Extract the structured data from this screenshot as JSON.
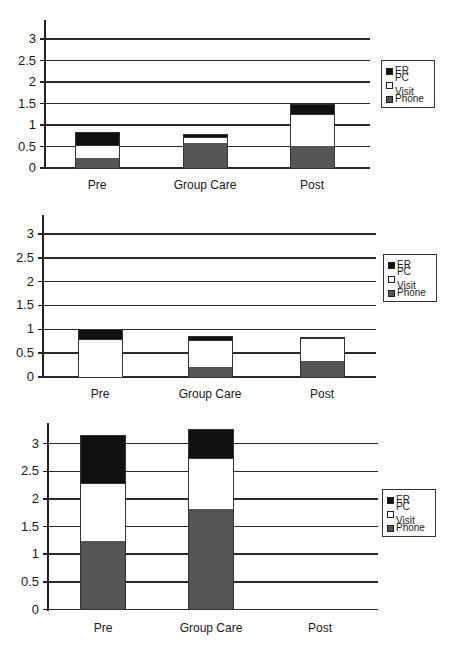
{
  "legend": {
    "items": [
      {
        "label": "ER",
        "color": "#111111"
      },
      {
        "label": "PC Visit",
        "color": "#ffffff"
      },
      {
        "label": "Phone",
        "color": "#555555"
      }
    ]
  },
  "chart_data": [
    {
      "type": "bar",
      "stacked": true,
      "title": "",
      "xlabel": "",
      "ylabel": "",
      "categories": [
        "Pre",
        "Group Care",
        "Post"
      ],
      "yticks": [
        "0",
        "0.5",
        "1",
        "1.5",
        "2",
        "2.5",
        "3"
      ],
      "ylim": [
        0,
        3.4
      ],
      "grid": true,
      "legend_position": "right",
      "series": [
        {
          "name": "Phone",
          "values": [
            0.23,
            0.6,
            0.53
          ]
        },
        {
          "name": "PC Visit",
          "values": [
            0.32,
            0.15,
            0.74
          ]
        },
        {
          "name": "ER",
          "values": [
            0.28,
            0.05,
            0.21
          ]
        }
      ],
      "totals": [
        0.83,
        0.8,
        1.48
      ]
    },
    {
      "type": "bar",
      "stacked": true,
      "title": "",
      "xlabel": "",
      "ylabel": "",
      "categories": [
        "Pre",
        "Group Care",
        "Post"
      ],
      "yticks": [
        "0",
        "0.5",
        "1",
        "1.5",
        "2",
        "2.5",
        "3"
      ],
      "ylim": [
        0,
        3.4
      ],
      "grid": true,
      "legend_position": "right",
      "series": [
        {
          "name": "Phone",
          "values": [
            0.0,
            0.21,
            0.34
          ]
        },
        {
          "name": "PC Visit",
          "values": [
            0.81,
            0.58,
            0.5
          ]
        },
        {
          "name": "ER",
          "values": [
            0.19,
            0.08,
            0.0
          ]
        }
      ],
      "totals": [
        1.0,
        0.87,
        0.84
      ]
    },
    {
      "type": "bar",
      "stacked": true,
      "title": "",
      "xlabel": "",
      "ylabel": "",
      "categories": [
        "Pre",
        "Group Care",
        "Post"
      ],
      "yticks": [
        "0",
        "0.5",
        "1",
        "1.5",
        "2",
        "2.5",
        "3"
      ],
      "ylim": [
        0,
        3.4
      ],
      "grid": true,
      "legend_position": "right",
      "series": [
        {
          "name": "Phone",
          "values": [
            1.25,
            1.82,
            0
          ]
        },
        {
          "name": "PC Visit",
          "values": [
            1.05,
            0.94,
            0
          ]
        },
        {
          "name": "ER",
          "values": [
            0.86,
            0.51,
            0
          ]
        }
      ],
      "totals": [
        3.16,
        3.27,
        0
      ]
    }
  ]
}
